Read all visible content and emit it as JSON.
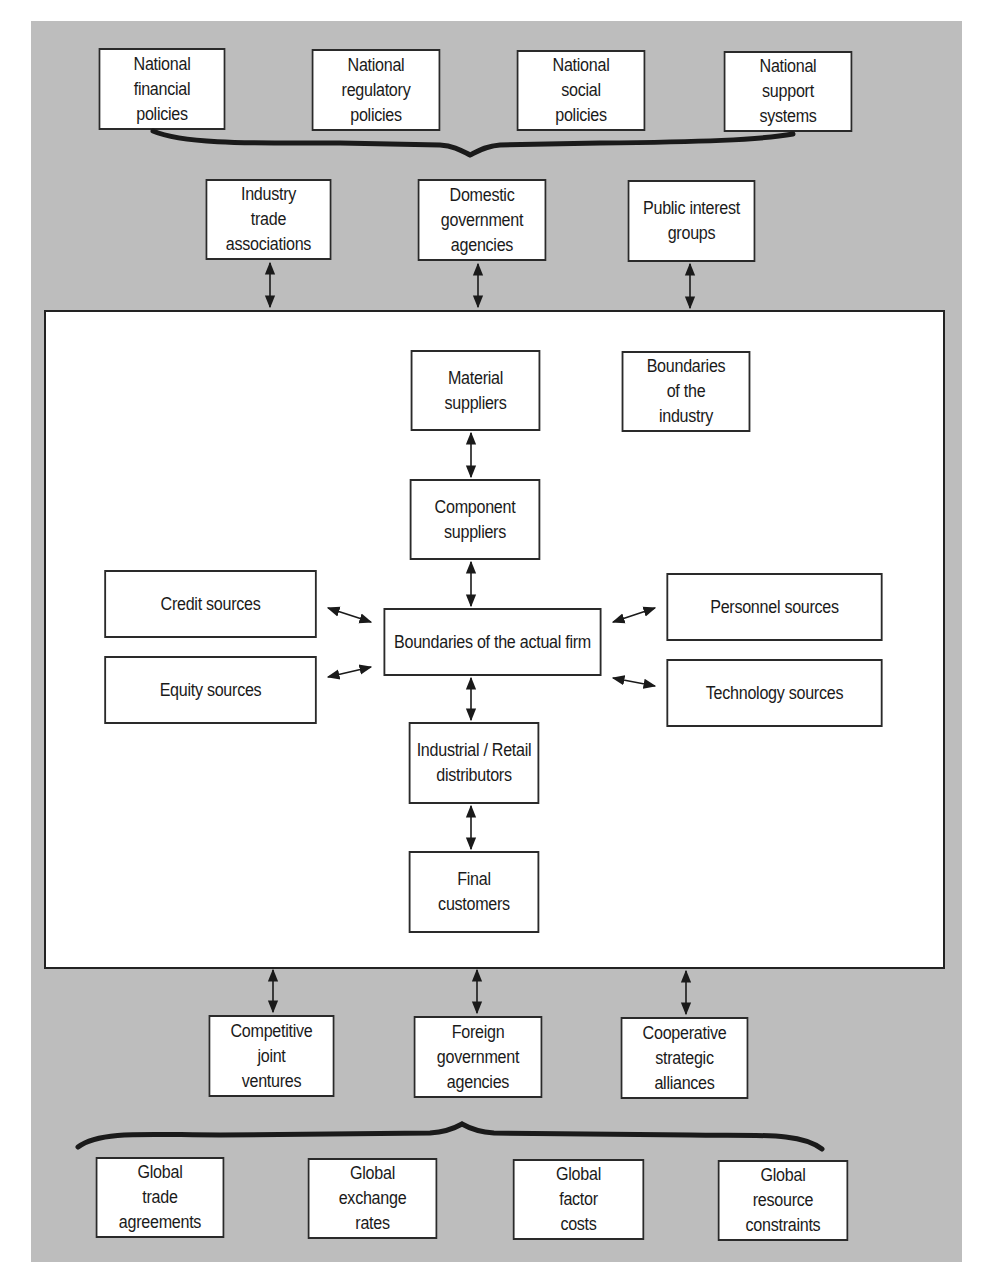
{
  "diagram": {
    "national_policies": [
      "National\nfinancial\npolicies",
      "National\nregulatory\npolicies",
      "National\nsocial\npolicies",
      "National\nsupport\nsystems"
    ],
    "domestic_actors": [
      "Industry\ntrade\nassociations",
      "Domestic\ngovernment\nagencies",
      "Public interest\ngroups"
    ],
    "industry_boundary_label": "Boundaries\nof the\nindustry",
    "value_chain": {
      "material_suppliers": "Material\nsuppliers",
      "component_suppliers": "Component\nsuppliers",
      "firm": "Boundaries of the actual firm",
      "distributors": "Industrial / Retail\ndistributors",
      "final_customers": "Final\ncustomers"
    },
    "left_sources": [
      "Credit sources",
      "Equity sources"
    ],
    "right_sources": [
      "Personnel sources",
      "Technology sources"
    ],
    "foreign_actors": [
      "Competitive\njoint\nventures",
      "Foreign\ngovernment\nagencies",
      "Cooperative\nstrategic\nalliances"
    ],
    "global_factors": [
      "Global\ntrade\nagreements",
      "Global\nexchange\nrates",
      "Global\nfactor\ncosts",
      "Global\nresource\nconstraints"
    ]
  },
  "colors": {
    "background": "#bdbdbd",
    "box_fill": "#ffffff",
    "line": "#1a1a1a"
  }
}
